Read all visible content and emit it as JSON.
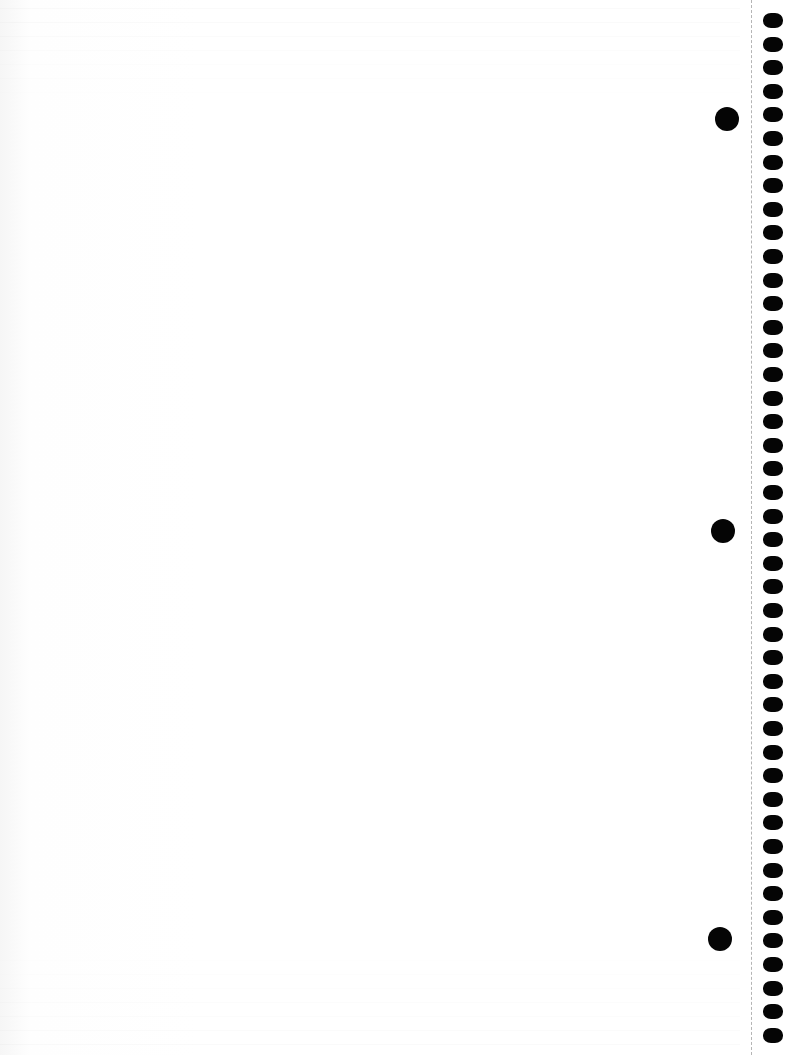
{
  "page": {
    "type": "scanned notebook page",
    "content_text": "",
    "background_color": "#ffffff"
  },
  "binding": {
    "perforation_x": 751,
    "spiral_hole_count": 44,
    "spiral_hole_spacing": 23.6,
    "spiral_hole_first_top": 13,
    "hole_color": "#050505"
  },
  "punch_holes": [
    {
      "cx": 727,
      "cy": 119
    },
    {
      "cx": 723,
      "cy": 531
    },
    {
      "cx": 720,
      "cy": 939
    }
  ]
}
